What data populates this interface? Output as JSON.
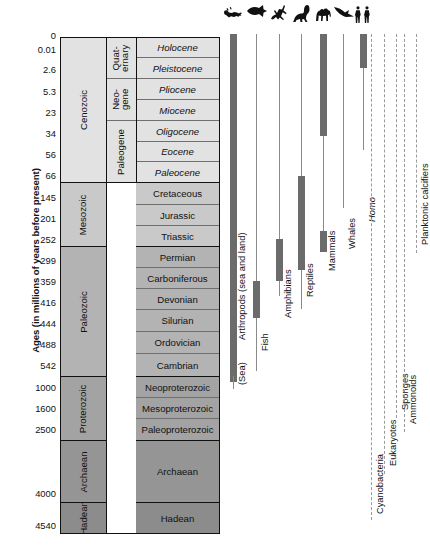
{
  "axis": {
    "caption": "Ages (in millions of years before present)",
    "ticks": [
      {
        "label": "0",
        "y": 36
      },
      {
        "label": "0.01",
        "y": 50
      },
      {
        "label": "2.6",
        "y": 70
      },
      {
        "label": "5.3",
        "y": 92
      },
      {
        "label": "23",
        "y": 113
      },
      {
        "label": "34",
        "y": 134
      },
      {
        "label": "56",
        "y": 155
      },
      {
        "label": "66",
        "y": 176
      },
      {
        "label": "145",
        "y": 198
      },
      {
        "label": "201",
        "y": 219
      },
      {
        "label": "252",
        "y": 240
      },
      {
        "label": "299",
        "y": 261
      },
      {
        "label": "359",
        "y": 282
      },
      {
        "label": "416",
        "y": 303
      },
      {
        "label": "444",
        "y": 324
      },
      {
        "label": "488",
        "y": 345
      },
      {
        "label": "542",
        "y": 366
      },
      {
        "label": "1000",
        "y": 388
      },
      {
        "label": "1600",
        "y": 409
      },
      {
        "label": "2500",
        "y": 430
      },
      {
        "label": "4000",
        "y": 494
      },
      {
        "label": "4540",
        "y": 526
      }
    ]
  },
  "columns": {
    "eras": [
      {
        "name": "Cenozoic",
        "top": 0,
        "height": 145,
        "shade": "s1",
        "major": true
      },
      {
        "name": "Mesozoic",
        "top": 145,
        "height": 64,
        "shade": "s2",
        "major": true
      },
      {
        "name": "Paleozoic",
        "top": 209,
        "height": 130,
        "shade": "s3",
        "major": true
      },
      {
        "name": "Proterozoic",
        "top": 339,
        "height": 64,
        "shade": "s4",
        "major": true
      },
      {
        "name": "Archaean",
        "top": 403,
        "height": 62,
        "shade": "s5",
        "major": true
      },
      {
        "name": "Hadean",
        "top": 465,
        "height": 30,
        "shade": "s6",
        "major": false
      }
    ],
    "subperiods": [
      {
        "name": "Quat-\nernary",
        "top": 0,
        "height": 41,
        "shade": "s1"
      },
      {
        "name": "Neo-\ngene",
        "top": 41,
        "height": 42,
        "shade": "s1"
      },
      {
        "name": "Paleogene",
        "top": 83,
        "height": 62,
        "shade": "s1"
      }
    ],
    "periods": [
      {
        "name": "Holocene",
        "top": 0,
        "height": 20,
        "shade": "s1",
        "italic": true,
        "major": false
      },
      {
        "name": "Pleistocene",
        "top": 20,
        "height": 21,
        "shade": "s1",
        "italic": true,
        "major": false
      },
      {
        "name": "Pliocene",
        "top": 41,
        "height": 21,
        "shade": "s1",
        "italic": true,
        "major": false
      },
      {
        "name": "Miocene",
        "top": 62,
        "height": 21,
        "shade": "s1",
        "italic": true,
        "major": false
      },
      {
        "name": "Oligocene",
        "top": 83,
        "height": 21,
        "shade": "s1",
        "italic": true,
        "major": false
      },
      {
        "name": "Eocene",
        "top": 104,
        "height": 20,
        "shade": "s1",
        "italic": true,
        "major": false
      },
      {
        "name": "Paleocene",
        "top": 124,
        "height": 21,
        "shade": "s1",
        "italic": true,
        "major": true
      },
      {
        "name": "Cretaceous",
        "top": 145,
        "height": 22,
        "shade": "s2",
        "italic": false,
        "major": false
      },
      {
        "name": "Jurassic",
        "top": 167,
        "height": 21,
        "shade": "s2",
        "italic": false,
        "major": false
      },
      {
        "name": "Triassic",
        "top": 188,
        "height": 21,
        "shade": "s2",
        "italic": false,
        "major": true
      },
      {
        "name": "Permian",
        "top": 209,
        "height": 21,
        "shade": "s3",
        "italic": false,
        "major": false
      },
      {
        "name": "Carboniferous",
        "top": 230,
        "height": 21,
        "shade": "s3",
        "italic": false,
        "major": false
      },
      {
        "name": "Devonian",
        "top": 251,
        "height": 21,
        "shade": "s3",
        "italic": false,
        "major": false
      },
      {
        "name": "Silurian",
        "top": 272,
        "height": 22,
        "shade": "s3",
        "italic": false,
        "major": false
      },
      {
        "name": "Ordovician",
        "top": 294,
        "height": 22,
        "shade": "s3",
        "italic": false,
        "major": false
      },
      {
        "name": "Cambrian",
        "top": 316,
        "height": 23,
        "shade": "s3",
        "italic": false,
        "major": true
      },
      {
        "name": "Neoproterozoic",
        "top": 339,
        "height": 21,
        "shade": "s4",
        "italic": false,
        "major": false
      },
      {
        "name": "Mesoproterozoic",
        "top": 360,
        "height": 21,
        "shade": "s4",
        "italic": false,
        "major": false
      },
      {
        "name": "Paleoproterozoic",
        "top": 381,
        "height": 22,
        "shade": "s4",
        "italic": false,
        "major": true
      },
      {
        "name": "Archaean",
        "top": 403,
        "height": 62,
        "shade": "s5",
        "italic": false,
        "major": true
      },
      {
        "name": "Hadean",
        "top": 465,
        "height": 30,
        "shade": "s6",
        "italic": false,
        "major": false
      }
    ]
  },
  "ranges": [
    {
      "name": "Arthropods (sea and land)",
      "icon": "scorpion-icon",
      "italic": false,
      "x": 233,
      "label_y": 340,
      "stem_top": 34,
      "stem_bottom": 382,
      "thick": [
        {
          "top": 34,
          "bottom": 382
        }
      ],
      "style": "thick-full",
      "dashed": false
    },
    {
      "name": "(Sea)",
      "icon": null,
      "italic": false,
      "x": 233,
      "label_y": 385,
      "stem_top": 376,
      "stem_bottom": 389,
      "thick": [],
      "style": "tail",
      "dashed": false
    },
    {
      "name": "Fish",
      "icon": "fish-icon",
      "italic": false,
      "x": 256,
      "label_y": 351,
      "stem_top": 34,
      "stem_bottom": 371,
      "thick": [
        {
          "top": 281,
          "bottom": 318
        }
      ],
      "style": "stem-thick",
      "dashed": false
    },
    {
      "name": "Amphibians",
      "icon": "amphibian-icon",
      "italic": false,
      "x": 279,
      "label_y": 318,
      "stem_top": 34,
      "stem_bottom": 296,
      "thick": [
        {
          "top": 239,
          "bottom": 281
        }
      ],
      "style": "stem-thick",
      "dashed": false
    },
    {
      "name": "Reptiles",
      "icon": "dinosaur-icon",
      "italic": false,
      "x": 301,
      "label_y": 297,
      "stem_top": 34,
      "stem_bottom": 309,
      "thick": [
        {
          "top": 176,
          "bottom": 270
        }
      ],
      "style": "stem-thick",
      "dashed": false
    },
    {
      "name": "Mammals",
      "icon": "camel-icon",
      "italic": false,
      "x": 323,
      "label_y": 271,
      "stem_top": 34,
      "stem_bottom": 252,
      "thick": [
        {
          "top": 34,
          "bottom": 136
        },
        {
          "top": 231,
          "bottom": 252
        }
      ],
      "style": "stem-thick",
      "dashed": false
    },
    {
      "name": "Whales",
      "icon": "whale-icon",
      "italic": false,
      "x": 343,
      "label_y": 249,
      "stem_top": 34,
      "stem_bottom": 208,
      "thick": [],
      "style": "stem",
      "dashed": false
    },
    {
      "name": "Homo",
      "icon": "humans-icon",
      "italic": true,
      "x": 363,
      "label_y": 222,
      "stem_top": 34,
      "stem_bottom": 150,
      "thick": [
        {
          "top": 34,
          "bottom": 68
        }
      ],
      "style": "stem-thick",
      "dashed": false
    },
    {
      "name": "Cyanobacteria",
      "icon": null,
      "italic": false,
      "x": 371,
      "label_y": 514,
      "stem_top": 34,
      "stem_bottom": 520,
      "thick": [],
      "style": "dashed",
      "dashed": true
    },
    {
      "name": "Eukaryotes",
      "icon": null,
      "italic": false,
      "x": 384,
      "label_y": 466,
      "stem_top": 34,
      "stem_bottom": 474,
      "thick": [],
      "style": "dashed",
      "dashed": true
    },
    {
      "name": "Sponges",
      "icon": null,
      "italic": false,
      "x": 396,
      "label_y": 410,
      "stem_top": 34,
      "stem_bottom": 418,
      "thick": [],
      "style": "dashed",
      "dashed": true
    },
    {
      "name": "Ammonoids",
      "icon": null,
      "italic": false,
      "x": 404,
      "label_y": 424,
      "stem_top": 34,
      "stem_bottom": 432,
      "thick": [],
      "style": "dashed",
      "dashed": true
    },
    {
      "name": "Planktonic calcifiers",
      "icon": null,
      "italic": false,
      "x": 416,
      "label_y": 245,
      "stem_top": 34,
      "stem_bottom": 253,
      "thick": [],
      "style": "dashed",
      "dashed": true
    }
  ]
}
